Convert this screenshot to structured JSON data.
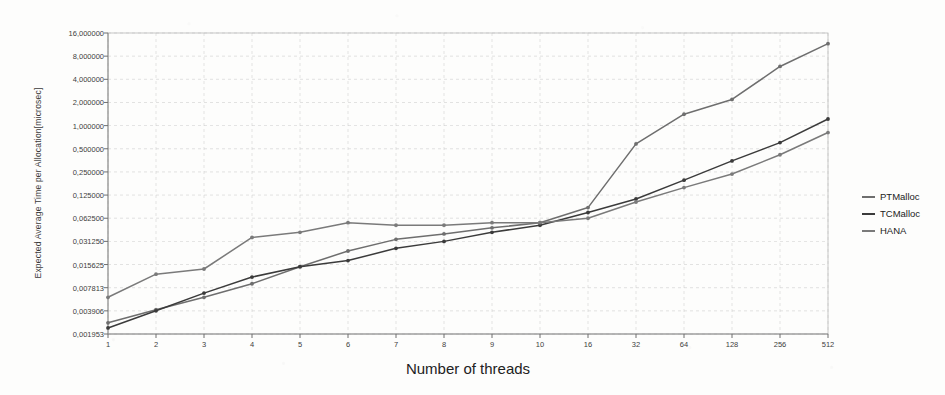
{
  "chart_data": {
    "type": "line",
    "title": "",
    "xlabel": "Number of threads",
    "ylabel": "Expected Average Time per Allocation[microsec]",
    "yscale": "log2",
    "ylim": [
      0.001953,
      16.0
    ],
    "grid": true,
    "legend_position": "right",
    "categories": [
      "1",
      "2",
      "3",
      "4",
      "5",
      "6",
      "7",
      "8",
      "9",
      "10",
      "16",
      "32",
      "64",
      "128",
      "256",
      "512"
    ],
    "ytick_labels": [
      "16,000000",
      "8,000000",
      "4,000000",
      "2,000000",
      "1,000000",
      "0,500000",
      "0,250000",
      "0,125000",
      "0,062500",
      "0,031250",
      "0,015625",
      "0,007813",
      "0,003906",
      "0,001953"
    ],
    "ytick_values": [
      16.0,
      8.0,
      4.0,
      2.0,
      1.0,
      0.5,
      0.25,
      0.125,
      0.0625,
      0.03125,
      0.015625,
      0.007813,
      0.003906,
      0.001953
    ],
    "series": [
      {
        "name": "PTMalloc",
        "color": "#6e6e6e",
        "values": [
          0.00273,
          0.00404,
          0.00586,
          0.00879,
          0.01465,
          0.02344,
          0.0332,
          0.03906,
          0.04688,
          0.05469,
          0.08594,
          0.5781,
          1.4063,
          2.1875,
          5.875,
          11.625
        ]
      },
      {
        "name": "TCMalloc",
        "color": "#3b3b3b",
        "values": [
          0.00234,
          0.00391,
          0.00664,
          0.01074,
          0.01465,
          0.01758,
          0.02539,
          0.03125,
          0.04102,
          0.05078,
          0.07422,
          0.1113,
          0.1953,
          0.3477,
          0.6016,
          1.2188
        ]
      },
      {
        "name": "HANA",
        "color": "#7a7a7a",
        "values": [
          0.00586,
          0.01172,
          0.01367,
          0.03516,
          0.04102,
          0.05469,
          0.05078,
          0.05078,
          0.05469,
          0.05469,
          0.0625,
          0.1016,
          0.1563,
          0.2344,
          0.418,
          0.8125
        ]
      }
    ]
  },
  "legend": {
    "entries": [
      {
        "label": "PTMalloc"
      },
      {
        "label": "TCMalloc"
      },
      {
        "label": "HANA"
      }
    ]
  }
}
